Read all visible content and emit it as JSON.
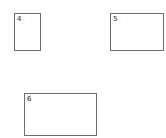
{
  "boxes": [
    {
      "label": "4",
      "x": 14,
      "y": 13,
      "w": 26,
      "h": 38
    },
    {
      "label": "5",
      "x": 110,
      "y": 13,
      "w": 54,
      "h": 38
    },
    {
      "label": "6",
      "x": 24,
      "y": 93,
      "w": 73,
      "h": 43
    }
  ],
  "colors": {
    "border": "#6e6e6e",
    "background": "#ffffff"
  }
}
